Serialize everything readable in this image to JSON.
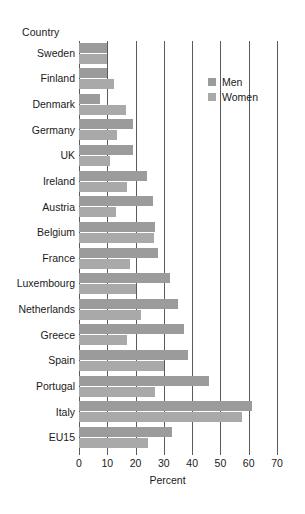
{
  "chart_data": {
    "type": "bar",
    "orientation": "horizontal",
    "title": "",
    "xlabel": "Percent",
    "ylabel": "Country",
    "xlim": [
      0,
      70
    ],
    "xticks": [
      0,
      10,
      20,
      30,
      40,
      50,
      60,
      70
    ],
    "xtick_labels": [
      "0",
      "10",
      "20",
      "30",
      "40",
      "50",
      "60",
      "70"
    ],
    "grid": true,
    "grid_axis": "x",
    "legend_position": "upper-right-inside",
    "categories": [
      "Sweden",
      "Finland",
      "Denmark",
      "Germany",
      "UK",
      "Ireland",
      "Austria",
      "Belgium",
      "France",
      "Luxembourg",
      "Netherlands",
      "Greece",
      "Spain",
      "Portugal",
      "Italy",
      "EU15"
    ],
    "series": [
      {
        "name": "Men",
        "color": "#9b9b9b",
        "values": [
          10,
          10,
          7.5,
          19,
          19,
          24,
          26,
          27,
          28,
          32,
          35,
          37,
          38.5,
          46,
          61,
          33
        ]
      },
      {
        "name": "Women",
        "color": "#a9a9a9",
        "values": [
          10,
          12.5,
          16.5,
          13.5,
          11,
          17,
          13,
          26.5,
          18,
          20,
          22,
          17,
          30,
          27,
          57.5,
          24.5
        ]
      }
    ]
  },
  "axis": {
    "y_caption": "Country",
    "x_title": "Percent"
  },
  "legend": {
    "items": [
      {
        "label": "Men"
      },
      {
        "label": "Women"
      }
    ]
  },
  "colors": {
    "men": "#9b9b9b",
    "women": "#a9a9a9",
    "grid": "#5a5a5a",
    "background": "#ffffff"
  }
}
